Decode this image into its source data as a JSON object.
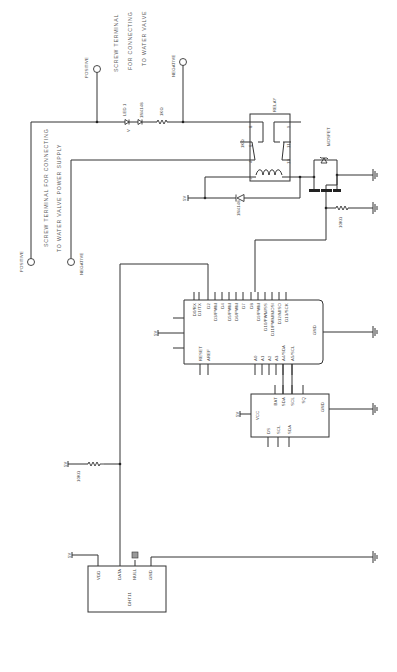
{
  "diagram": {
    "orientation": "rotated 90 degrees (read with page turned)"
  },
  "terminals": {
    "valve": {
      "caption_lines": [
        "SCREW TERMINAL",
        "FOR CONNECTING",
        "TO WATER VALVE"
      ],
      "positive_label": "POSITIVE",
      "negative_label": "NEGATIVE"
    },
    "power_supply": {
      "caption_lines": [
        "SCREW TERMINAL FOR CONNECTING",
        "TO WATER VALVE POWER SUPPLY"
      ],
      "positive_label": "POSITIVE",
      "negative_label": "NEGATIVE"
    }
  },
  "components": {
    "led": {
      "label": "LED 1"
    },
    "led_diode": {
      "label": "1N4148"
    },
    "led_resistor": {
      "label": "1KΩ"
    },
    "relay": {
      "label": "RELAY",
      "pins": [
        "8",
        "6",
        "4",
        "+",
        "9",
        "11",
        "13",
        "-"
      ],
      "contact_label": "1KΩ"
    },
    "flyback_diode": {
      "label": "1N4148"
    },
    "mosfet": {
      "label": "MOSFET"
    },
    "gate_resistor": {
      "label": "10KΩ"
    },
    "pullup_resistor": {
      "label": "10KΩ"
    },
    "arduino": {
      "top_pins": [
        "D0/RX",
        "D1/TX",
        "D2",
        "D3/PWM",
        "D4",
        "D5/PWM",
        "D6/PWM",
        "D7",
        "D8",
        "D9/PWM",
        "D10/PWM/SS",
        "D11/PWM/MOSI",
        "D12/MISO",
        "D13/SCK"
      ],
      "bottom_pins": [
        "RESET",
        "AREF",
        "A0",
        "A1",
        "A2",
        "A3",
        "A4/SDA",
        "A5/SCL"
      ],
      "right_pin": "GND",
      "supply_label": "5V"
    },
    "rtc": {
      "left_label": "VCC",
      "top_pins": [
        "BAT",
        "SDA",
        "SCL",
        "SQ"
      ],
      "bottom_pins": [
        "DS",
        "SCL",
        "SDA"
      ],
      "right_pin": "GND",
      "supply_label": "5V"
    },
    "dht11": {
      "label": "DHT11",
      "pins": [
        "VDD",
        "DATA",
        "NULL",
        "GND"
      ],
      "supply_label": "5V"
    }
  },
  "supply_labels": {
    "relay_5v": "5V",
    "pullup_5v": "5V",
    "dht_5v": "5V"
  }
}
